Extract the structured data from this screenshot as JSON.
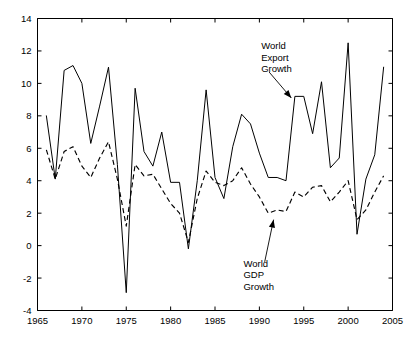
{
  "chart_data": {
    "type": "line",
    "title": "",
    "subtitle": "",
    "xlabel": "",
    "ylabel": "",
    "xlim": [
      1965,
      2005
    ],
    "ylim": [
      -4,
      14
    ],
    "xticks": [
      1965,
      1970,
      1975,
      1980,
      1985,
      1990,
      1995,
      2000,
      2005
    ],
    "xtick_labels": [
      "1965",
      "1970",
      "1975",
      "1980",
      "1985",
      "1990",
      "1995",
      "2000",
      "2005"
    ],
    "yticks": [
      -4,
      -2,
      0,
      2,
      4,
      6,
      8,
      10,
      12,
      14
    ],
    "ytick_labels": [
      "-4",
      "-2",
      "0",
      "2",
      "4",
      "6",
      "8",
      "10",
      "12",
      "14"
    ],
    "grid": false,
    "legend": "none",
    "x": [
      1966,
      1967,
      1968,
      1969,
      1970,
      1971,
      1972,
      1973,
      1974,
      1975,
      1976,
      1977,
      1978,
      1979,
      1980,
      1981,
      1982,
      1983,
      1984,
      1985,
      1986,
      1987,
      1988,
      1989,
      1990,
      1991,
      1992,
      1993,
      1994,
      1995,
      1996,
      1997,
      1998,
      1999,
      2000,
      2001,
      2002,
      2003,
      2004
    ],
    "series": [
      {
        "name": "World Export Growth",
        "style": "solid",
        "values": [
          8.0,
          4.1,
          10.8,
          11.1,
          10.0,
          6.3,
          8.6,
          11.0,
          5.0,
          -2.9,
          9.7,
          5.8,
          4.9,
          7.0,
          3.9,
          3.9,
          -0.2,
          4.0,
          9.6,
          4.2,
          2.9,
          6.1,
          8.1,
          7.5,
          5.7,
          4.2,
          4.2,
          4.0,
          9.2,
          9.2,
          6.9,
          10.1,
          4.8,
          5.4,
          12.5,
          0.7,
          4.1,
          5.6,
          11.0
        ]
      },
      {
        "name": "World GDP Growth",
        "style": "dashed",
        "values": [
          5.9,
          4.1,
          5.8,
          6.1,
          4.9,
          4.2,
          5.4,
          6.4,
          4.1,
          1.2,
          5.0,
          4.3,
          4.4,
          3.5,
          2.6,
          2.0,
          0.2,
          2.9,
          4.6,
          3.9,
          3.7,
          4.0,
          4.8,
          3.8,
          3.0,
          2.0,
          2.2,
          2.1,
          3.3,
          3.0,
          3.6,
          3.7,
          2.7,
          3.3,
          4.0,
          1.6,
          2.2,
          3.3,
          4.3
        ]
      }
    ],
    "annotations": [
      {
        "name": "world-export-growth",
        "lines": [
          "World",
          "Export",
          "Growth"
        ],
        "text_x": 1990.2,
        "text_y": 12.1,
        "arrow_from": [
          1991.1,
          10.7
        ],
        "arrow_to": [
          1993.6,
          9.1
        ]
      },
      {
        "name": "world-gdp-growth",
        "lines": [
          "World",
          "GDP",
          "Growth"
        ],
        "text_x": 1988.2,
        "text_y": -1.3,
        "arrow_from": [
          1990.6,
          -1.0
        ],
        "arrow_to": [
          1991.6,
          1.6
        ]
      }
    ]
  }
}
